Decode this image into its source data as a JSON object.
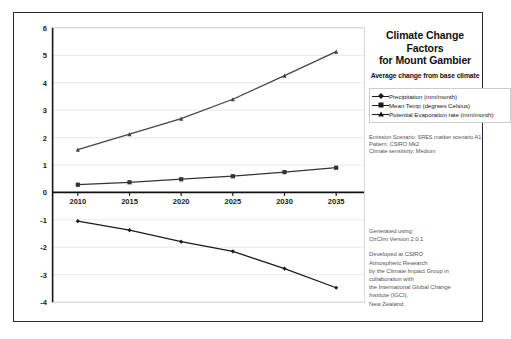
{
  "chart_data": {
    "type": "line",
    "title": "Climate Change Factors for Mount Gambier",
    "title_line1": "Climate Change Factors",
    "title_line2": "for Mount Gambier",
    "subtitle": "Average change from base climate",
    "xlabel": "",
    "ylabel": "",
    "categories": [
      "2010",
      "2015",
      "2020",
      "2025",
      "2030",
      "2035"
    ],
    "x": [
      2010,
      2015,
      2020,
      2025,
      2030,
      2035
    ],
    "ylim": [
      -4,
      6
    ],
    "yticks": [
      "6",
      "5",
      "4",
      "3",
      "2",
      "1",
      "0",
      "-1",
      "-2",
      "-3",
      "-4"
    ],
    "ytick_values": [
      6,
      5,
      4,
      3,
      2,
      1,
      0,
      -1,
      -2,
      -3,
      -4
    ],
    "grid": true,
    "legend_position": "right",
    "series": [
      {
        "name": "Precipitation (mm/month)",
        "marker": "diamond",
        "color": "#1a1a1a",
        "values": [
          -1.05,
          -1.38,
          -1.8,
          -2.15,
          -2.78,
          -3.48
        ]
      },
      {
        "name": "Mean Temp (degrees Celsius)",
        "marker": "square",
        "color": "#333333",
        "values": [
          0.28,
          0.37,
          0.48,
          0.59,
          0.74,
          0.9
        ]
      },
      {
        "name": "Potential Evaporation rate (mm/month)",
        "marker": "triangle",
        "color": "#444444",
        "values": [
          1.56,
          2.13,
          2.69,
          3.4,
          4.26,
          5.14
        ]
      }
    ]
  },
  "legend": {
    "items": [
      "Precipitation (mm/month)",
      "Mean Temp (degrees Celsius)",
      "Potential Evaporation rate (mm/month)"
    ]
  },
  "metadata": {
    "lines": [
      "Emission Scenario: SRES marker scenario A1",
      "Pattern: CSIRO  Mk2",
      "Climate sensitivity: Medium"
    ]
  },
  "generated": {
    "lines_group1": [
      "Generated using:",
      "OzClim Version 2.0.1"
    ],
    "lines_group2": [
      "Developed at CSIRO",
      "Atmospheric Research",
      "by the Climate Impact Group in",
      "collaboration with",
      "the International Global Change",
      "Institute (IGCI),",
      "New Zealand."
    ]
  },
  "colors": {
    "frame": "#2b2b2b",
    "grid": "#e2e2e2",
    "axis": "#111111",
    "text": "#222222",
    "muted": "#555555"
  }
}
